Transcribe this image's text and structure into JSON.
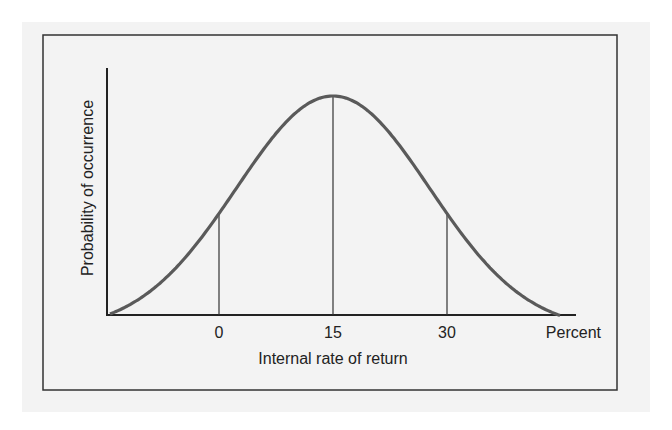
{
  "chart_data": {
    "type": "line",
    "title": "",
    "xlabel": "Internal rate of return",
    "ylabel": "Probability of occurrence",
    "x_unit_label": "Percent",
    "x_ticks": [
      "0",
      "15",
      "30"
    ],
    "series": [
      {
        "name": "Probability distribution",
        "shape": "normal",
        "mean": 15,
        "x": [
          -15,
          -10,
          -5,
          0,
          5,
          10,
          15,
          20,
          25,
          30,
          35,
          40,
          45
        ],
        "values": [
          0.0,
          0.05,
          0.2,
          0.5,
          0.78,
          0.95,
          1.0,
          0.95,
          0.78,
          0.5,
          0.2,
          0.05,
          0.0
        ]
      }
    ],
    "vertical_markers": [
      0,
      15,
      30
    ],
    "grid": false,
    "legend": "none"
  },
  "colors": {
    "curve": "#555555",
    "axes": "#222222",
    "frame": "#333333",
    "background": "#f3f3f3"
  }
}
